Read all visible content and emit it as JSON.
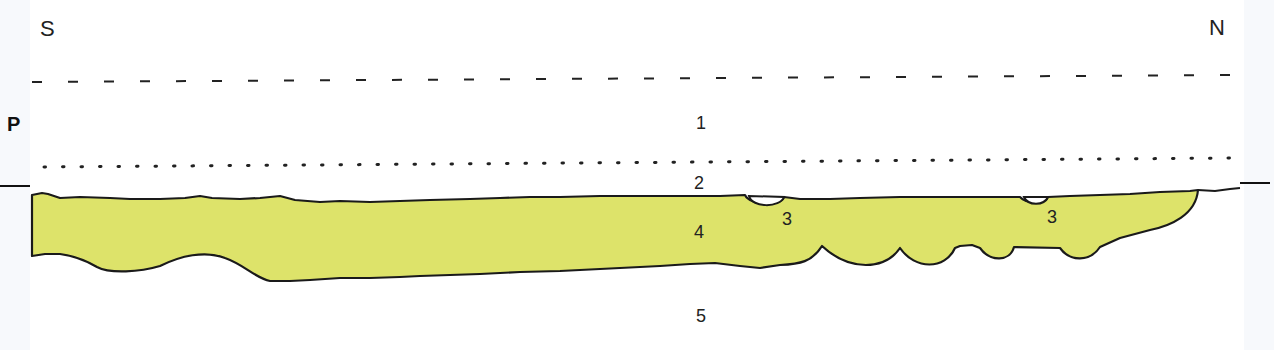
{
  "figure": {
    "type": "stratigraphic-section",
    "orientation": {
      "left": "S",
      "right": "N"
    },
    "profile_marker": "P",
    "layers": [
      {
        "id": "1",
        "label": "1"
      },
      {
        "id": "2",
        "label": "2"
      },
      {
        "id": "3a",
        "label": "3"
      },
      {
        "id": "3b",
        "label": "3"
      },
      {
        "id": "4",
        "label": "4"
      },
      {
        "id": "5",
        "label": "5"
      }
    ],
    "colors": {
      "layer4_fill": "#DDE36A",
      "outline": "#1a1a1a",
      "background": "#FFFFFF"
    }
  }
}
